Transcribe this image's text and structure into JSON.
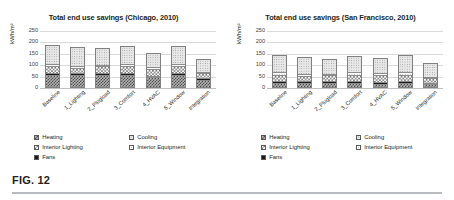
{
  "caption": "FIG. 12",
  "legend": {
    "items": [
      {
        "label": "Heating",
        "pattern": "p-heating"
      },
      {
        "label": "Cooling",
        "pattern": "p-cooling"
      },
      {
        "label": "Interior Lighting",
        "pattern": "p-intlight"
      },
      {
        "label": "Interior Equipment",
        "pattern": "p-intequip"
      },
      {
        "label": "Fans",
        "pattern": "p-fans"
      }
    ]
  },
  "chart_data": [
    {
      "type": "bar",
      "stacked": true,
      "title": "Total end use savings (Chicago, 2010)",
      "xlabel": "",
      "ylabel": "kWh/m²",
      "ylim": [
        0,
        250
      ],
      "yticks": [
        0,
        50,
        100,
        150,
        200,
        250
      ],
      "grid": true,
      "legend_position": "bottom-left",
      "categories": [
        "Baseline",
        "1_Lighting",
        "2_Plugload",
        "3_Comfort",
        "4_HVAC",
        "5_Window",
        "Integration"
      ],
      "series": [
        {
          "name": "Heating",
          "values": [
            47,
            47,
            47,
            47,
            38,
            47,
            27
          ]
        },
        {
          "name": "Fans",
          "values": [
            9,
            9,
            9,
            9,
            8,
            9,
            7
          ]
        },
        {
          "name": "Interior Lighting",
          "values": [
            30,
            22,
            30,
            30,
            30,
            30,
            22
          ]
        },
        {
          "name": "Interior Equipment",
          "values": [
            9,
            9,
            4,
            9,
            9,
            9,
            4
          ]
        },
        {
          "name": "Cooling",
          "values": [
            85,
            85,
            76,
            81,
            59,
            81,
            58
          ]
        }
      ],
      "totals": [
        180,
        172,
        166,
        176,
        144,
        176,
        118
      ]
    },
    {
      "type": "bar",
      "stacked": true,
      "title": "Total end use savings (San Francisco, 2010)",
      "xlabel": "",
      "ylabel": "kWh/m²",
      "ylim": [
        0,
        250
      ],
      "yticks": [
        0,
        50,
        100,
        150,
        200,
        250
      ],
      "grid": true,
      "legend_position": "bottom-left",
      "categories": [
        "Baseline",
        "1_Lighting",
        "2_Plugload",
        "3_Comfort",
        "4_HVAC",
        "5_Window",
        "Integration"
      ],
      "series": [
        {
          "name": "Heating",
          "values": [
            13,
            13,
            13,
            13,
            11,
            13,
            9
          ]
        },
        {
          "name": "Fans",
          "values": [
            7,
            7,
            7,
            7,
            6,
            7,
            5
          ]
        },
        {
          "name": "Interior Lighting",
          "values": [
            30,
            22,
            30,
            30,
            30,
            30,
            22
          ]
        },
        {
          "name": "Interior Equipment",
          "values": [
            10,
            10,
            5,
            10,
            10,
            10,
            5
          ]
        },
        {
          "name": "Cooling",
          "values": [
            75,
            75,
            64,
            73,
            66,
            75,
            61
          ]
        }
      ],
      "totals": [
        135,
        127,
        119,
        133,
        123,
        135,
        102
      ]
    }
  ]
}
